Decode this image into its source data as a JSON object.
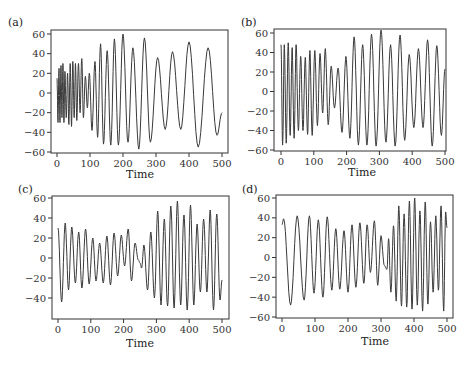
{
  "chart_data": [
    {
      "type": "line",
      "panel_label": "(a)",
      "xlabel": "Time",
      "ylabel": "",
      "xlim": [
        0,
        500
      ],
      "ylim": [
        -60,
        60
      ],
      "xticks": [
        0,
        100,
        200,
        300,
        400,
        500
      ],
      "yticks": [
        60,
        40,
        20,
        0,
        -20,
        -40,
        -60
      ],
      "grid": false,
      "series": [
        {
          "name": "signal",
          "extrema": [
            [
              0,
              15
            ],
            [
              3,
              -30
            ],
            [
              6,
              25
            ],
            [
              9,
              -30
            ],
            [
              12,
              28
            ],
            [
              15,
              -25
            ],
            [
              18,
              30
            ],
            [
              21,
              -30
            ],
            [
              24,
              22
            ],
            [
              28,
              -25
            ],
            [
              32,
              20
            ],
            [
              36,
              -32
            ],
            [
              40,
              30
            ],
            [
              44,
              -34
            ],
            [
              48,
              32
            ],
            [
              52,
              -25
            ],
            [
              56,
              30
            ],
            [
              60,
              -28
            ],
            [
              65,
              30
            ],
            [
              70,
              -20
            ],
            [
              75,
              35
            ],
            [
              80,
              -25
            ],
            [
              86,
              17
            ],
            [
              92,
              -15
            ],
            [
              98,
              20
            ],
            [
              106,
              -38
            ],
            [
              115,
              32
            ],
            [
              123,
              -45
            ],
            [
              132,
              50
            ],
            [
              141,
              -52
            ],
            [
              152,
              43
            ],
            [
              163,
              -53
            ],
            [
              174,
              55
            ],
            [
              186,
              -53
            ],
            [
              200,
              60
            ],
            [
              215,
              -50
            ],
            [
              230,
              46
            ],
            [
              248,
              -57
            ],
            [
              265,
              56
            ],
            [
              283,
              -50
            ],
            [
              305,
              36
            ],
            [
              328,
              -37
            ],
            [
              350,
              42
            ],
            [
              375,
              -37
            ],
            [
              400,
              52
            ],
            [
              428,
              -55
            ],
            [
              458,
              46
            ],
            [
              485,
              -43
            ],
            [
              500,
              -20
            ]
          ]
        }
      ]
    },
    {
      "type": "line",
      "panel_label": "(b)",
      "xlabel": "Time",
      "ylabel": "",
      "xlim": [
        0,
        500
      ],
      "ylim": [
        -60,
        60
      ],
      "xticks": [
        0,
        100,
        200,
        300,
        400,
        500
      ],
      "yticks": [
        60,
        40,
        20,
        0,
        -20,
        -40,
        -60
      ],
      "grid": false,
      "series": [
        {
          "name": "signal",
          "extrema": [
            [
              0,
              48
            ],
            [
              5,
              -55
            ],
            [
              10,
              48
            ],
            [
              16,
              -53
            ],
            [
              22,
              50
            ],
            [
              28,
              -45
            ],
            [
              34,
              45
            ],
            [
              40,
              -48
            ],
            [
              46,
              48
            ],
            [
              53,
              -40
            ],
            [
              60,
              36
            ],
            [
              67,
              -40
            ],
            [
              74,
              35
            ],
            [
              81,
              -44
            ],
            [
              88,
              42
            ],
            [
              95,
              -45
            ],
            [
              103,
              42
            ],
            [
              111,
              -35
            ],
            [
              119,
              39
            ],
            [
              127,
              -22
            ],
            [
              135,
              44
            ],
            [
              144,
              -34
            ],
            [
              153,
              26
            ],
            [
              163,
              -17
            ],
            [
              174,
              24
            ],
            [
              186,
              -42
            ],
            [
              198,
              36
            ],
            [
              210,
              -48
            ],
            [
              223,
              56
            ],
            [
              236,
              -55
            ],
            [
              249,
              48
            ],
            [
              262,
              -55
            ],
            [
              276,
              59
            ],
            [
              290,
              -56
            ],
            [
              305,
              63
            ],
            [
              320,
              -52
            ],
            [
              334,
              48
            ],
            [
              348,
              -56
            ],
            [
              363,
              58
            ],
            [
              377,
              -50
            ],
            [
              391,
              38
            ],
            [
              405,
              -37
            ],
            [
              419,
              44
            ],
            [
              433,
              -37
            ],
            [
              447,
              53
            ],
            [
              461,
              -56
            ],
            [
              475,
              47
            ],
            [
              489,
              -45
            ],
            [
              500,
              23
            ]
          ]
        }
      ]
    },
    {
      "type": "line",
      "panel_label": "(c)",
      "xlabel": "Time",
      "ylabel": "",
      "xlim": [
        0,
        500
      ],
      "ylim": [
        -60,
        60
      ],
      "xticks": [
        0,
        100,
        200,
        300,
        400,
        500
      ],
      "yticks": [
        60,
        40,
        20,
        0,
        -20,
        -40
      ],
      "grid": false,
      "series": [
        {
          "name": "signal",
          "extrema": [
            [
              0,
              30
            ],
            [
              11,
              -44
            ],
            [
              22,
              35
            ],
            [
              32,
              -32
            ],
            [
              42,
              31
            ],
            [
              53,
              -25
            ],
            [
              63,
              26
            ],
            [
              73,
              -30
            ],
            [
              84,
              29
            ],
            [
              95,
              -26
            ],
            [
              106,
              20
            ],
            [
              116,
              -23
            ],
            [
              127,
              15
            ],
            [
              138,
              -25
            ],
            [
              149,
              22
            ],
            [
              160,
              -27
            ],
            [
              171,
              25
            ],
            [
              182,
              -18
            ],
            [
              193,
              23
            ],
            [
              203,
              -8
            ],
            [
              214,
              29
            ],
            [
              224,
              -23
            ],
            [
              235,
              15
            ],
            [
              245,
              -2
            ],
            [
              250,
              -5
            ],
            [
              255,
              -10
            ],
            [
              262,
              13
            ],
            [
              273,
              -32
            ],
            [
              283,
              26
            ],
            [
              294,
              -40
            ],
            [
              304,
              47
            ],
            [
              314,
              -47
            ],
            [
              324,
              39
            ],
            [
              334,
              -48
            ],
            [
              344,
              52
            ],
            [
              354,
              -50
            ],
            [
              364,
              57
            ],
            [
              374,
              -47
            ],
            [
              384,
              43
            ],
            [
              394,
              -52
            ],
            [
              404,
              53
            ],
            [
              414,
              -47
            ],
            [
              424,
              34
            ],
            [
              434,
              -34
            ],
            [
              444,
              39
            ],
            [
              454,
              -34
            ],
            [
              464,
              48
            ],
            [
              474,
              -52
            ],
            [
              484,
              44
            ],
            [
              494,
              -42
            ],
            [
              500,
              -22
            ]
          ]
        }
      ]
    },
    {
      "type": "line",
      "panel_label": "(d)",
      "xlabel": "Time",
      "ylabel": "",
      "xlim": [
        0,
        500
      ],
      "ylim": [
        -60,
        60
      ],
      "xticks": [
        0,
        100,
        200,
        300,
        400,
        500
      ],
      "yticks": [
        60,
        40,
        20,
        0,
        -20,
        -40,
        -60
      ],
      "grid": false,
      "series": [
        {
          "name": "signal",
          "extrema": [
            [
              0,
              33
            ],
            [
              5,
              39
            ],
            [
              26,
              -48
            ],
            [
              46,
              42
            ],
            [
              67,
              -43
            ],
            [
              83,
              42
            ],
            [
              97,
              -36
            ],
            [
              110,
              38
            ],
            [
              124,
              -40
            ],
            [
              137,
              41
            ],
            [
              151,
              -33
            ],
            [
              163,
              29
            ],
            [
              175,
              -32
            ],
            [
              188,
              27
            ],
            [
              200,
              -35
            ],
            [
              212,
              33
            ],
            [
              224,
              -30
            ],
            [
              236,
              35
            ],
            [
              248,
              -26
            ],
            [
              258,
              33
            ],
            [
              268,
              -15
            ],
            [
              280,
              37
            ],
            [
              290,
              -28
            ],
            [
              300,
              22
            ],
            [
              310,
              -8
            ],
            [
              318,
              -12
            ],
            [
              323,
              19
            ],
            [
              330,
              -35
            ],
            [
              338,
              32
            ],
            [
              346,
              -44
            ],
            [
              354,
              52
            ],
            [
              362,
              -49
            ],
            [
              370,
              44
            ],
            [
              378,
              -50
            ],
            [
              386,
              57
            ],
            [
              394,
              -52
            ],
            [
              402,
              60
            ],
            [
              410,
              -48
            ],
            [
              418,
              47
            ],
            [
              426,
              -54
            ],
            [
              434,
              56
            ],
            [
              442,
              -47
            ],
            [
              450,
              36
            ],
            [
              458,
              -35
            ],
            [
              466,
              42
            ],
            [
              474,
              -33
            ],
            [
              482,
              52
            ],
            [
              490,
              -54
            ],
            [
              496,
              46
            ],
            [
              500,
              30
            ]
          ]
        }
      ]
    }
  ],
  "panels": [
    {
      "label": "(a)",
      "xlabel": "Time",
      "xticks": [
        "0",
        "100",
        "200",
        "300",
        "400",
        "500"
      ],
      "yticks": [
        "60",
        "40",
        "20",
        "0",
        "−20",
        "−40",
        "−60"
      ]
    },
    {
      "label": "(b)",
      "xlabel": "Time",
      "xticks": [
        "0",
        "100",
        "200",
        "300",
        "400",
        "500"
      ],
      "yticks": [
        "60",
        "40",
        "20",
        "0",
        "−20",
        "−40",
        "−60"
      ]
    },
    {
      "label": "(c)",
      "xlabel": "Time",
      "xticks": [
        "0",
        "100",
        "200",
        "300",
        "400",
        "500"
      ],
      "yticks": [
        "60",
        "40",
        "20",
        "0",
        "−20",
        "−40"
      ]
    },
    {
      "label": "(d)",
      "xlabel": "Time",
      "xticks": [
        "0",
        "100",
        "200",
        "300",
        "400",
        "500"
      ],
      "yticks": [
        "60",
        "40",
        "20",
        "0",
        "−20",
        "−40",
        "−60"
      ]
    }
  ],
  "colors": {
    "line": "#3a3a3a",
    "axis": "#333333",
    "text": "#222222"
  }
}
